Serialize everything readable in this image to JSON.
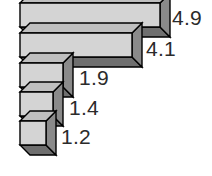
{
  "chart_data": {
    "type": "bar",
    "orientation": "horizontal",
    "style": "3d-isometric",
    "title": "",
    "subtitle": "",
    "xlabel": "",
    "ylabel": "",
    "categories": [
      "",
      "",
      "",
      "",
      ""
    ],
    "values": [
      4.9,
      4.1,
      1.9,
      1.4,
      1.2
    ],
    "data_labels": [
      "4.9",
      "4.1",
      "1.9",
      "1.4",
      "1.2"
    ],
    "xlim": [
      0,
      4.9
    ],
    "grid": false,
    "legend": null,
    "axis_ticks": [],
    "colors": {
      "bar_face": "#d4d4d4",
      "bar_top": "#bfbfbf",
      "bar_side": "#8a8a8a",
      "bar_bottom": "#6f6f6f",
      "outline": "#000000",
      "label_text": "#2b2b2b",
      "background": "#ffffff"
    },
    "bars": [
      {
        "value": 4.9,
        "label": "4.9",
        "face_x": 20,
        "face_y": 3,
        "face_w": 140,
        "face_h": 24,
        "depth": 10,
        "label_x": 172,
        "label_y": 7
      },
      {
        "value": 4.1,
        "label": "4.1",
        "face_x": 20,
        "face_y": 33,
        "face_w": 112,
        "face_h": 24,
        "depth": 10,
        "label_x": 146,
        "label_y": 38
      },
      {
        "value": 1.9,
        "label": "1.9",
        "face_x": 20,
        "face_y": 63,
        "face_w": 43,
        "face_h": 24,
        "depth": 10,
        "label_x": 79,
        "label_y": 67
      },
      {
        "value": 1.4,
        "label": "1.4",
        "face_x": 20,
        "face_y": 92,
        "face_w": 33,
        "face_h": 24,
        "depth": 10,
        "label_x": 69,
        "label_y": 97
      },
      {
        "value": 1.2,
        "label": "1.2",
        "face_x": 20,
        "face_y": 121,
        "face_w": 26,
        "face_h": 24,
        "depth": 10,
        "label_x": 61,
        "label_y": 126
      }
    ]
  }
}
